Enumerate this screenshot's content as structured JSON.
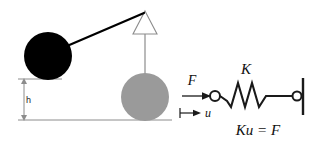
{
  "figure": {
    "background_color": "#ffffff"
  },
  "pendulum": {
    "pivot_label": "pivot-support-arrowhead",
    "rod_label": "pendulum-rod",
    "raised_bob": {
      "name": "black-bob",
      "color": "#000000",
      "radius": 24,
      "cx": 48,
      "cy": 56
    },
    "rest_bob": {
      "name": "gray-bob",
      "color": "#9a9a9a",
      "radius": 24,
      "cx": 145,
      "cy": 97
    },
    "pivot": {
      "x": 145,
      "y": 12
    },
    "height_dimension": {
      "label": "h",
      "top_y": 79,
      "bottom_y": 120,
      "x": 24
    },
    "ground_line_y": 120,
    "line_color": "#8c8c8c",
    "rod_color": "#000000"
  },
  "spring_system": {
    "force_label": "F",
    "displacement_label": "u",
    "stiffness_label": "K",
    "equation": "Ku = F",
    "force_arrow": {
      "x1": 182,
      "x2": 210,
      "y": 96
    },
    "displacement_arrow": {
      "x1": 180,
      "x2": 200,
      "y": 113
    },
    "node_circle": {
      "cx": 215,
      "cy": 96,
      "r": 5
    },
    "anchor_circle": {
      "cx": 297,
      "cy": 96,
      "r": 4.5
    },
    "wall": {
      "x": 303,
      "y1": 78,
      "y2": 115
    },
    "coil_count": 3,
    "stroke_color": "#1a1a1a"
  },
  "colors": {
    "black": "#000000",
    "gray_fill": "#9a9a9a",
    "thin_gray": "#8c8c8c",
    "ink": "#1a1a1a"
  }
}
